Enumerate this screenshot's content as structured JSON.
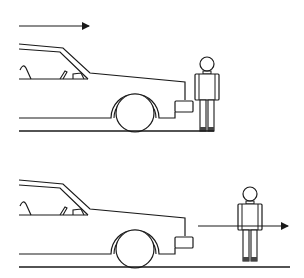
{
  "diagram": {
    "colors": {
      "stroke": "#1a1a1a",
      "background": "#ffffff"
    },
    "panels": [
      {
        "id": "top",
        "motion_arrow": {
          "direction": "right",
          "subject": "car"
        },
        "pedestrian_position": "touching bumper"
      },
      {
        "id": "bottom",
        "motion_arrow": {
          "direction": "right",
          "subject": "pedestrian"
        },
        "pedestrian_position": "ahead of car"
      }
    ]
  }
}
